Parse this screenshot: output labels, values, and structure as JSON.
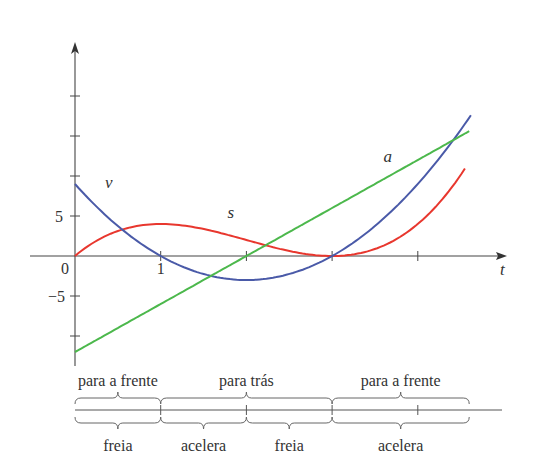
{
  "chart_data": {
    "type": "line",
    "title": "",
    "xlabel": "t",
    "ylabel": "",
    "xlim": [
      0,
      5
    ],
    "ylim": [
      -12,
      25
    ],
    "x_ticks": [
      0,
      1,
      2,
      3,
      4
    ],
    "x_tick_labels": {
      "0": "0",
      "1": "1"
    },
    "y_ticks": [
      -10,
      -5,
      0,
      5,
      10,
      15,
      20
    ],
    "y_tick_labels": {
      "5": "5",
      "-5": "−5"
    },
    "grid": false,
    "series": [
      {
        "name": "s",
        "label": "s",
        "formula": "t^3 - 6t^2 + 9t",
        "color": "#e8372e",
        "x": [
          0,
          0.5,
          1,
          1.5,
          2,
          2.5,
          3,
          3.5,
          4,
          4.6
        ],
        "values": [
          0,
          3.125,
          4,
          3.375,
          2,
          0.625,
          0,
          0.875,
          4,
          11.8
        ]
      },
      {
        "name": "v",
        "label": "v",
        "formula": "3t^2 - 12t + 9",
        "color": "#4a5aa8",
        "x": [
          0,
          0.5,
          1,
          1.5,
          2,
          2.5,
          3,
          3.5,
          4,
          4.6
        ],
        "values": [
          9,
          3.75,
          0,
          -2.25,
          -3,
          -2.25,
          0,
          3.75,
          9,
          17.3
        ]
      },
      {
        "name": "a",
        "label": "a",
        "formula": "6t - 12",
        "color": "#4cb84c",
        "x": [
          0,
          4.6
        ],
        "values": [
          -12,
          15.6
        ]
      }
    ],
    "annotations": {
      "curve_labels": [
        {
          "text": "v",
          "t": 0.35,
          "y": 8.5
        },
        {
          "text": "s",
          "t": 1.78,
          "y": 4.8
        },
        {
          "text": "a",
          "t": 3.6,
          "y": 11.8
        }
      ],
      "direction_labels": [
        {
          "text": "para a frente",
          "from": 0,
          "to": 1
        },
        {
          "text": "para trás",
          "from": 1,
          "to": 3
        },
        {
          "text": "para a frente",
          "from": 3,
          "to": 4.6
        }
      ],
      "speed_labels": [
        {
          "text": "freia",
          "from": 0,
          "to": 1
        },
        {
          "text": "acelera",
          "from": 1,
          "to": 2
        },
        {
          "text": "freia",
          "from": 2,
          "to": 3
        },
        {
          "text": "acelera",
          "from": 3,
          "to": 4.6
        }
      ]
    }
  }
}
